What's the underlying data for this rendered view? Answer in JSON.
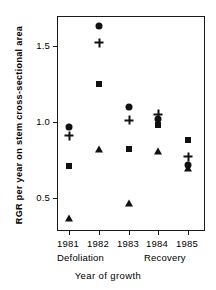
{
  "chart_data": {
    "type": "scatter",
    "title": "",
    "xlabel": "Year of growth",
    "ylabel": "RGR  per year on stem cross-sectional area",
    "categories": [
      "1981",
      "1982",
      "1983",
      "1984",
      "1985"
    ],
    "ylim": [
      0.28,
      1.73
    ],
    "yticks": [
      0.5,
      1.0,
      1.5
    ],
    "ytick_labels": [
      "0.5",
      "1.0",
      "1.5"
    ],
    "grid": false,
    "legend": "none",
    "annotations": [
      {
        "text": "Defoliation",
        "spans": [
          "1981",
          "1982",
          "1983"
        ]
      },
      {
        "text": "Recovery",
        "spans": [
          "1984",
          "1985"
        ]
      }
    ],
    "series": [
      {
        "name": "circle",
        "marker": "circle",
        "values": [
          0.97,
          1.63,
          1.1,
          1.02,
          0.72
        ]
      },
      {
        "name": "plus",
        "marker": "plus",
        "values": [
          0.91,
          1.52,
          1.01,
          1.05,
          0.77
        ]
      },
      {
        "name": "square",
        "marker": "square",
        "values": [
          0.71,
          1.25,
          0.82,
          0.98,
          0.88
        ]
      },
      {
        "name": "triangle",
        "marker": "triangle",
        "values": [
          0.37,
          0.82,
          0.47,
          0.81,
          0.7
        ]
      }
    ]
  },
  "axis": {
    "ytick_0": "0.5",
    "ytick_1": "1.0",
    "ytick_2": "1.5",
    "xtick_0": "1981",
    "xtick_1": "1982",
    "xtick_2": "1983",
    "xtick_3": "1984",
    "xtick_4": "1985"
  },
  "labels": {
    "y_axis_title": "RGR  per year on stem cross-sectional area",
    "x_axis_title": "Year of  growth",
    "phase_defoliation": "Defoliation",
    "phase_recovery": "Recovery"
  }
}
